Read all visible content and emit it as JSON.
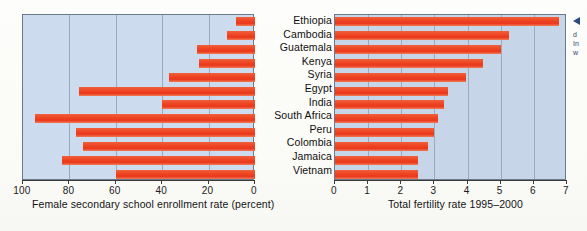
{
  "figure": {
    "countries": [
      "Ethiopia",
      "Cambodia",
      "Guatemala",
      "Kenya",
      "Syria",
      "Egypt",
      "India",
      "South Africa",
      "Peru",
      "Colombia",
      "Jamaica",
      "Vietnam"
    ],
    "callout": {
      "marker": "left-arrow-marker",
      "line1": "d",
      "line2": "In",
      "line3": "w"
    }
  },
  "chart_data": [
    {
      "type": "bar",
      "orientation": "horizontal",
      "id": "female-secondary-school-enrollment",
      "title": "",
      "xlabel": "Female secondary school enrollment rate (percent)",
      "ylabel": "",
      "categories": [
        "Ethiopia",
        "Cambodia",
        "Guatemala",
        "Kenya",
        "Syria",
        "Egypt",
        "India",
        "South Africa",
        "Peru",
        "Colombia",
        "Jamaica",
        "Vietnam"
      ],
      "values": [
        8,
        12,
        25,
        24,
        37,
        76,
        40,
        95,
        77,
        74,
        83,
        60
      ],
      "xlim": [
        100,
        0
      ],
      "reversed_axis": true,
      "ticks": [
        100,
        80,
        60,
        40,
        20,
        0
      ],
      "tick_labels": [
        "100",
        "80",
        "60",
        "40",
        "20",
        "0"
      ],
      "grid": true,
      "legend": "none",
      "bar_color": "#ee4422",
      "plot_background": "#ccdcee"
    },
    {
      "type": "bar",
      "orientation": "horizontal",
      "id": "total-fertility-rate",
      "title": "",
      "xlabel": "Total fertility rate 1995–2000",
      "ylabel": "",
      "categories": [
        "Ethiopia",
        "Cambodia",
        "Guatemala",
        "Kenya",
        "Syria",
        "Egypt",
        "India",
        "South Africa",
        "Peru",
        "Colombia",
        "Jamaica",
        "Vietnam"
      ],
      "values": [
        6.75,
        5.25,
        5.0,
        4.45,
        3.95,
        3.4,
        3.3,
        3.1,
        3.0,
        2.8,
        2.5,
        2.5
      ],
      "xlim": [
        0,
        7
      ],
      "reversed_axis": false,
      "ticks": [
        0,
        1,
        2,
        3,
        4,
        5,
        6,
        7
      ],
      "tick_labels": [
        "0",
        "1",
        "2",
        "3",
        "4",
        "5",
        "6",
        "7"
      ],
      "grid": true,
      "legend": "none",
      "bar_color": "#ee4422",
      "plot_background": "#c6d5e8"
    }
  ]
}
